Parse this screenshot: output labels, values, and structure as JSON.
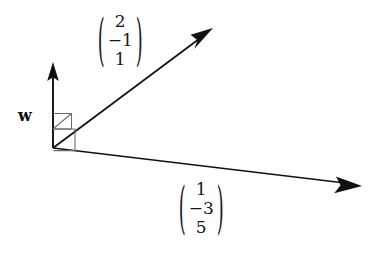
{
  "figure": {
    "type": "vector-diagram",
    "background_color": "#ffffff",
    "stroke_color": "#111111",
    "thin_stroke_color": "#555555",
    "origin": {
      "x": 53,
      "y": 148
    },
    "vectors": [
      {
        "name": "w",
        "label": "w",
        "label_style": "bold-italic-serif",
        "tip": {
          "x": 53,
          "y": 63
        },
        "direction": "up"
      },
      {
        "name": "vector-upper-right",
        "tip": {
          "x": 212,
          "y": 29
        },
        "direction": "up-right",
        "components": [
          "2",
          "−1",
          "1"
        ]
      },
      {
        "name": "vector-lower-right",
        "tip": {
          "x": 361,
          "y": 186
        },
        "direction": "right-slightly-down",
        "components": [
          "1",
          "−3",
          "5"
        ]
      }
    ],
    "right_angle_markers": [
      {
        "name": "right-angle-upper",
        "between": [
          "w",
          "vector-upper-right"
        ]
      },
      {
        "name": "right-angle-lower",
        "between": [
          "vector-upper-right",
          "vector-lower-right"
        ]
      }
    ],
    "labels": {
      "w": "w",
      "vec_top": {
        "a": "2",
        "b": "−1",
        "c": "1",
        "open_paren": "(",
        "close_paren": ")"
      },
      "vec_bottom": {
        "a": "1",
        "b": "−3",
        "c": "5",
        "open_paren": "(",
        "close_paren": ")"
      }
    }
  }
}
